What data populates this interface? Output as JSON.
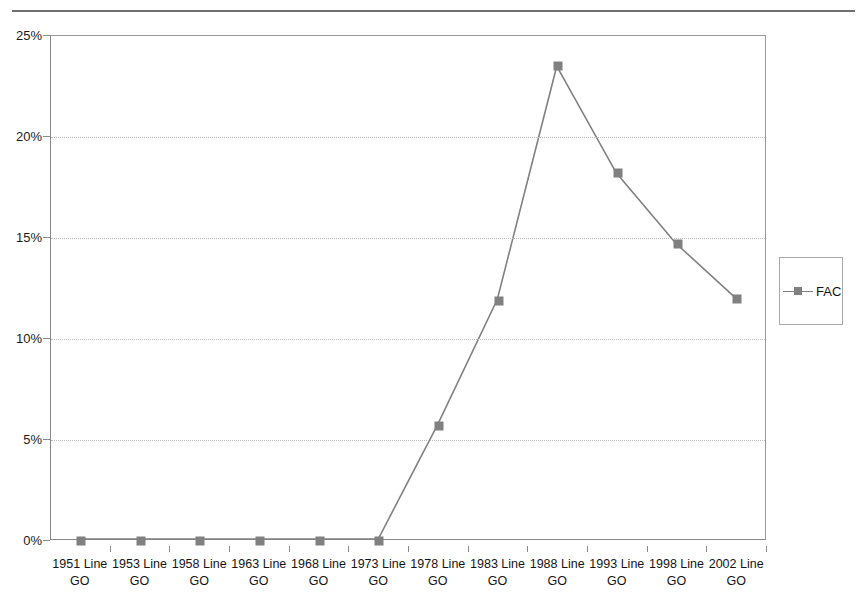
{
  "page": {
    "clipped_header_text": ""
  },
  "legend": {
    "position": "right",
    "entries": [
      {
        "label": "FAC",
        "color": "#808080",
        "marker": "square"
      }
    ]
  },
  "chart_data": {
    "type": "line",
    "title": "",
    "subtitle": "",
    "xlabel": "",
    "ylabel": "",
    "categories": [
      "1951 Line GO",
      "1953 Line GO",
      "1958 Line GO",
      "1963 Line GO",
      "1968 Line GO",
      "1973 Line GO",
      "1978 Line GO",
      "1983 Line GO",
      "1988 Line GO",
      "1993 Line GO",
      "1998 Line GO",
      "2002 Line GO"
    ],
    "category_lines": [
      [
        "1951 Line",
        "GO"
      ],
      [
        "1953 Line",
        "GO"
      ],
      [
        "1958 Line",
        "GO"
      ],
      [
        "1963 Line",
        "GO"
      ],
      [
        "1968 Line",
        "GO"
      ],
      [
        "1973 Line",
        "GO"
      ],
      [
        "1978 Line",
        "GO"
      ],
      [
        "1983 Line",
        "GO"
      ],
      [
        "1988 Line",
        "GO"
      ],
      [
        "1993 Line",
        "GO"
      ],
      [
        "1998 Line",
        "GO"
      ],
      [
        "2002 Line",
        "GO"
      ]
    ],
    "series": [
      {
        "name": "FAC",
        "color": "#808080",
        "marker": "square",
        "values": [
          0,
          0,
          0,
          0,
          0,
          0,
          5.7,
          11.9,
          23.5,
          18.2,
          14.7,
          12.0
        ]
      }
    ],
    "ylim": [
      0,
      25
    ],
    "yticks": [
      0,
      5,
      10,
      15,
      20,
      25
    ],
    "ytick_labels": [
      "0%",
      "5%",
      "10%",
      "15%",
      "20%",
      "25%"
    ],
    "ytick_suffix": "%",
    "grid": true,
    "grid_style": "dotted-horizontal",
    "legend_position": "right"
  }
}
